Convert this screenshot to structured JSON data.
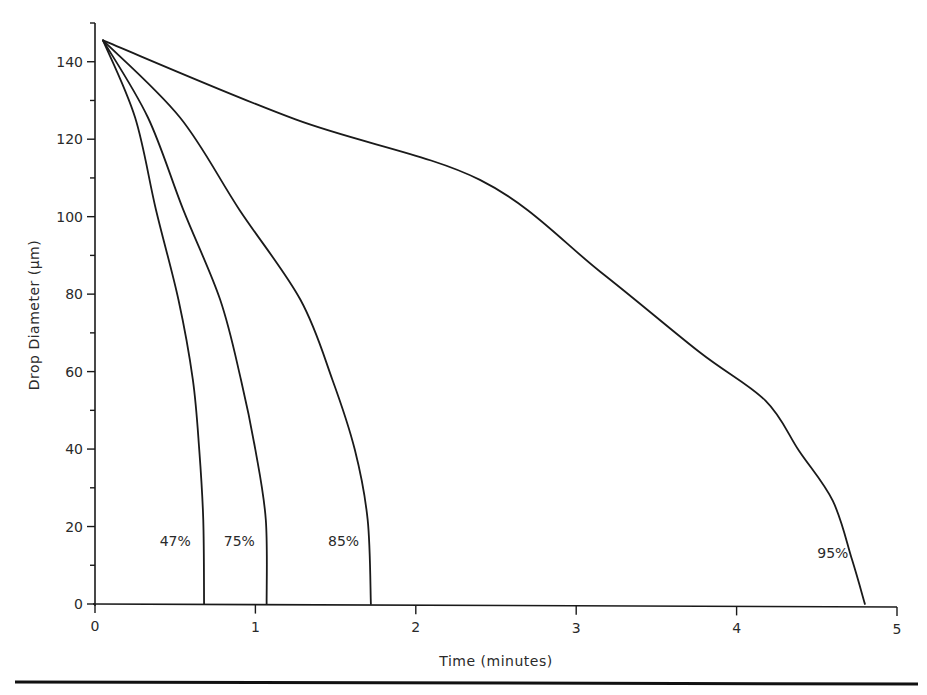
{
  "chart_data": {
    "type": "line",
    "title": "",
    "xlabel": "Time (minutes)",
    "ylabel": "Drop Diameter (μm)",
    "xlim": [
      0,
      5
    ],
    "ylim": [
      0,
      150
    ],
    "x_ticks": [
      0,
      1,
      2,
      3,
      4,
      5
    ],
    "x_tick_labels": [
      "0",
      "1",
      "2",
      "3",
      "4",
      "5"
    ],
    "y_ticks_major": [
      0,
      20,
      40,
      60,
      80,
      100,
      120,
      140
    ],
    "y_tick_labels": [
      "0",
      "20",
      "40",
      "60",
      "80",
      "100",
      "120",
      "140"
    ],
    "y_ticks_minor": [
      10,
      30,
      50,
      70,
      90,
      110,
      130,
      150
    ],
    "grid": false,
    "legend": "none (inline curve labels)",
    "series": [
      {
        "name": "47%",
        "points": [
          [
            0.05,
            145.5
          ],
          [
            0.25,
            125.6
          ],
          [
            0.38,
            101.8
          ],
          [
            0.52,
            78.6
          ],
          [
            0.61,
            57.9
          ],
          [
            0.65,
            39.8
          ],
          [
            0.675,
            21.7
          ],
          [
            0.68,
            0
          ]
        ]
      },
      {
        "name": "75%",
        "points": [
          [
            0.05,
            145.5
          ],
          [
            0.33,
            125.6
          ],
          [
            0.55,
            101.8
          ],
          [
            0.78,
            78.6
          ],
          [
            0.91,
            57.9
          ],
          [
            1.0,
            39.8
          ],
          [
            1.065,
            21.7
          ],
          [
            1.07,
            0
          ]
        ]
      },
      {
        "name": "85%",
        "points": [
          [
            0.05,
            145.5
          ],
          [
            0.53,
            125.6
          ],
          [
            0.9,
            101.8
          ],
          [
            1.28,
            78.6
          ],
          [
            1.48,
            57.9
          ],
          [
            1.62,
            39.8
          ],
          [
            1.7,
            21.7
          ],
          [
            1.72,
            0
          ]
        ]
      },
      {
        "name": "95%",
        "points": [
          [
            0.05,
            145.5
          ],
          [
            1.25,
            125.1
          ],
          [
            2.4,
            109.5
          ],
          [
            3.15,
            85.8
          ],
          [
            3.77,
            65.0
          ],
          [
            4.18,
            52.5
          ],
          [
            4.39,
            39.5
          ],
          [
            4.6,
            26.6
          ],
          [
            4.72,
            11.4
          ],
          [
            4.8,
            0
          ]
        ]
      }
    ],
    "annotations": [
      {
        "text": "47%",
        "series": "47%",
        "x": 0.5,
        "y": 15
      },
      {
        "text": "75%",
        "series": "75%",
        "x": 0.9,
        "y": 15
      },
      {
        "text": "85%",
        "series": "85%",
        "x": 1.55,
        "y": 15
      },
      {
        "text": "95%",
        "series": "95%",
        "x": 4.6,
        "y": 12
      }
    ]
  }
}
